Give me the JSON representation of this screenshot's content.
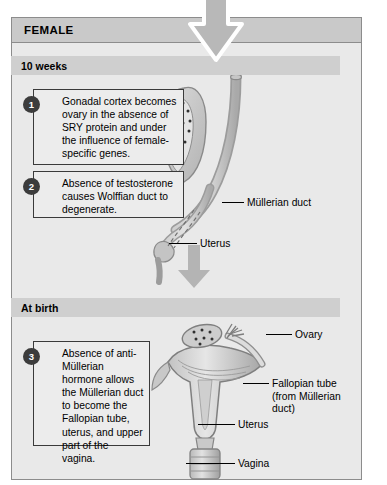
{
  "top_caption_sliver": "",
  "panel": {
    "title": "FEMALE",
    "sections": [
      {
        "id": "ten-weeks",
        "label": "10 weeks"
      },
      {
        "id": "at-birth",
        "label": "At birth"
      }
    ]
  },
  "callouts": [
    {
      "number": "1",
      "text": "Gonadal cortex becomes ovary in the absence of SRY protein and under the influence of female-specific genes."
    },
    {
      "number": "2",
      "text": "Absence of testosterone causes Wolffian duct to degenerate."
    },
    {
      "number": "3",
      "text": "Absence of anti-Müllerian hormone allows the Müllerian duct to become the Fallopian tube, uterus, and upper part of the vagina."
    }
  ],
  "labels": {
    "ten_weeks": {
      "mullerian_duct": "Müllerian duct",
      "uterus": "Uterus"
    },
    "at_birth": {
      "ovary": "Ovary",
      "fallopian_tube": "Fallopian tube\n(from Müllerian\nduct)",
      "uterus": "Uterus",
      "vagina": "Vagina"
    }
  },
  "colors": {
    "panel_background": "#e9e9e9",
    "panel_header": "#c9c9c9",
    "section_header": "#cfcfcf",
    "border": "#8c8c8c",
    "callout_border": "#3a3a3a",
    "badge": "#3c3c3c",
    "tissue_light": "#d3d3d3",
    "tissue_mid": "#b8b8b8",
    "tissue_dark": "#9a9a9a",
    "arrow_grey": "#b4b4b4"
  }
}
